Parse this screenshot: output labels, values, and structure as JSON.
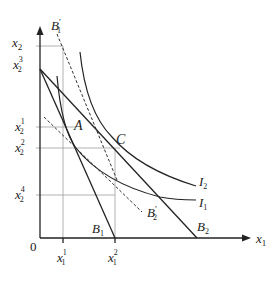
{
  "diagram": {
    "type": "indifference-curve-budget-line",
    "axes": {
      "x_label": "x",
      "x_sub": "1",
      "y_label": "x",
      "y_sub": "2",
      "origin": "0"
    },
    "y_ticks": [
      {
        "base": "x",
        "sub": "2",
        "sup": "3"
      },
      {
        "base": "x",
        "sub": "2",
        "sup": "1"
      },
      {
        "base": "x",
        "sub": "2",
        "sup": "2"
      },
      {
        "base": "x",
        "sub": "2",
        "sup": "4"
      }
    ],
    "x_ticks": [
      {
        "base": "x",
        "sub": "1",
        "sup": "1"
      },
      {
        "base": "x",
        "sub": "1",
        "sup": "2"
      }
    ],
    "points": {
      "A": "A",
      "C": "C"
    },
    "budget_lines": {
      "B1": {
        "base": "B",
        "sub": "1"
      },
      "B2": {
        "base": "B",
        "sub": "2"
      },
      "B1_prime": {
        "base": "B",
        "sub": "1",
        "prime": "′"
      },
      "B2_prime": {
        "base": "B",
        "sub": "2",
        "prime": "′"
      }
    },
    "curves": {
      "I1": {
        "base": "I",
        "sub": "1"
      },
      "I2": {
        "base": "I",
        "sub": "2"
      }
    },
    "colors": {
      "line": "#222222",
      "guide": "#999999"
    }
  }
}
